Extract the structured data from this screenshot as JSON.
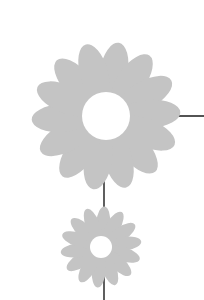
{
  "illustration": {
    "description": "Two stylized grey daisies connected by thin black lines",
    "colors": {
      "petal": "#c4c4c4",
      "center": "#ffffff",
      "line": "#1a1a1a",
      "background": "#ffffff"
    },
    "large_flower": {
      "cx": 106,
      "cy": 116,
      "center_r": 24,
      "petal_length": 60,
      "petal_width": 14,
      "petal_count": 14
    },
    "small_flower": {
      "cx": 101,
      "cy": 247,
      "center_r": 11,
      "petal_length": 34,
      "petal_width": 7,
      "petal_count": 14
    },
    "lines": [
      {
        "x1": 130,
        "y1": 116,
        "x2": 204,
        "y2": 116
      },
      {
        "x1": 104,
        "y1": 178,
        "x2": 104,
        "y2": 300
      }
    ]
  }
}
